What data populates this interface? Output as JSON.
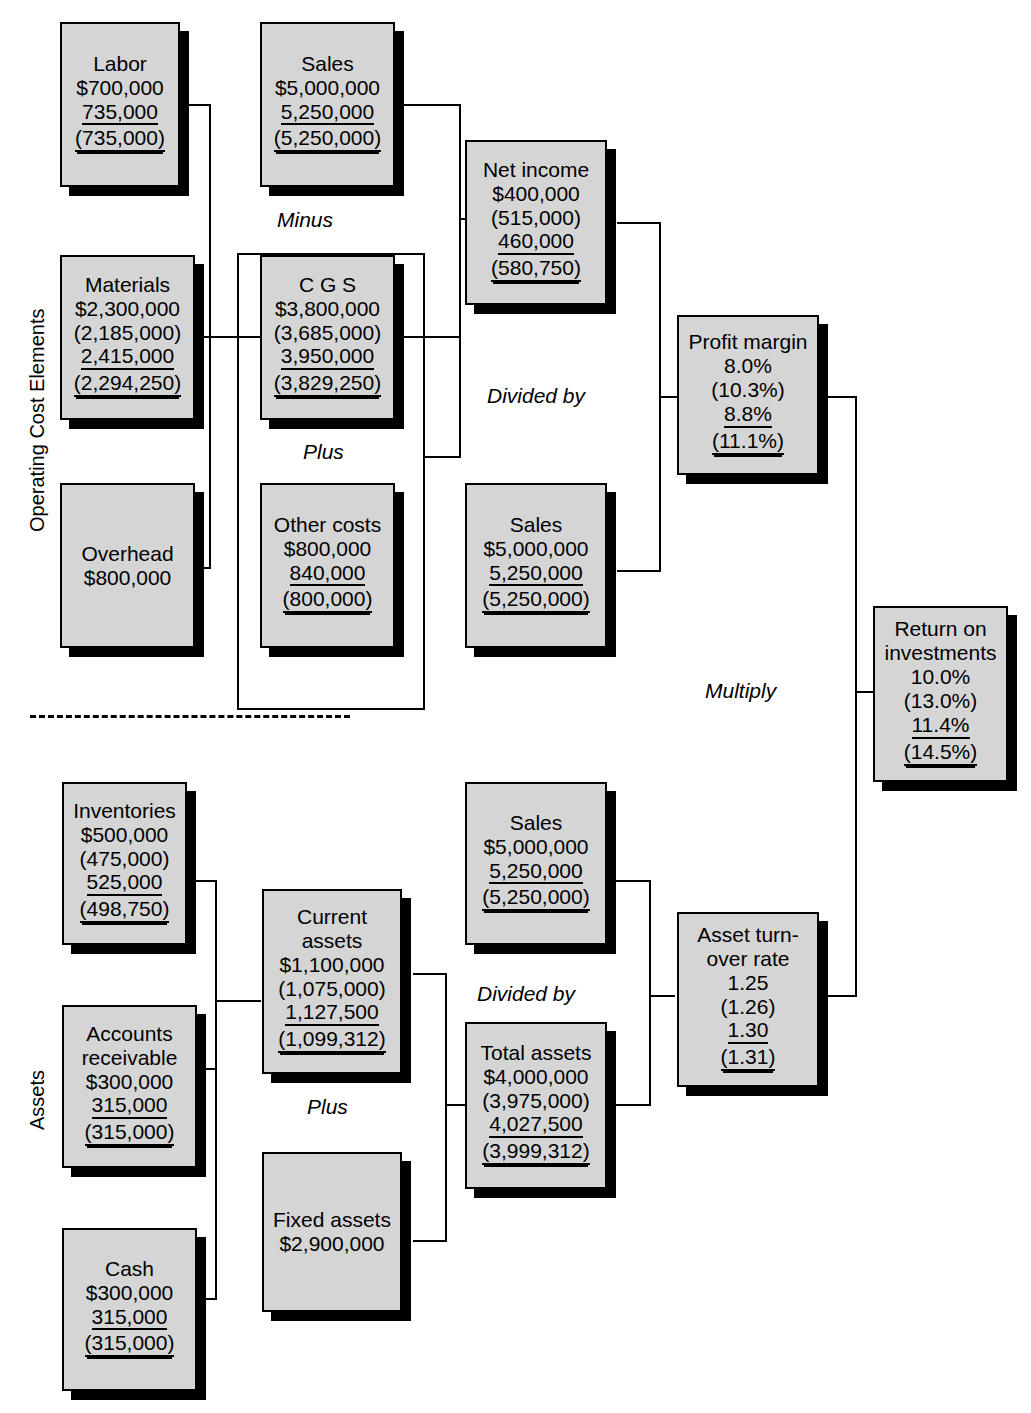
{
  "diagram": {
    "section_labels": {
      "top": "Operating Cost Elements",
      "bottom": "Assets"
    },
    "operators": {
      "minus": "Minus",
      "plus_top": "Plus",
      "divided_by_top": "Divided by",
      "multiply": "Multiply",
      "plus_bottom": "Plus",
      "divided_by_bottom": "Divided by"
    },
    "colors": {
      "box_fill": "#d5d5d5",
      "box_border": "#000000",
      "shadow": "#000000",
      "background": "#ffffff"
    }
  },
  "nodes": {
    "labor": {
      "title": "Labor",
      "lines": [
        "$700,000",
        "735,000",
        "(735,000)"
      ]
    },
    "materials": {
      "title": "Materials",
      "lines": [
        "$2,300,000",
        "(2,185,000)",
        "2,415,000",
        "(2,294,250)"
      ]
    },
    "overhead": {
      "title": "Overhead",
      "lines": [
        "$800,000"
      ]
    },
    "sales_top": {
      "title": "Sales",
      "lines": [
        "$5,000,000",
        "5,250,000",
        "(5,250,000)"
      ]
    },
    "cgs": {
      "title": "C G S",
      "lines": [
        "$3,800,000",
        "(3,685,000)",
        "3,950,000",
        "(3,829,250)"
      ]
    },
    "other_costs": {
      "title": "Other costs",
      "lines": [
        "$800,000",
        "840,000",
        "(800,000)"
      ]
    },
    "net_income": {
      "title": "Net income",
      "lines": [
        "$400,000",
        "(515,000)",
        "460,000",
        "(580,750)"
      ]
    },
    "sales_mid": {
      "title": "Sales",
      "lines": [
        "$5,000,000",
        "5,250,000",
        "(5,250,000)"
      ]
    },
    "profit_margin": {
      "title": "Profit margin",
      "lines": [
        "8.0%",
        "(10.3%)",
        "8.8%",
        "(11.1%)"
      ]
    },
    "return_on_investments": {
      "title_line1": "Return on",
      "title_line2": "investments",
      "lines": [
        "10.0%",
        "(13.0%)",
        "11.4%",
        "(14.5%)"
      ]
    },
    "inventories": {
      "title": "Inventories",
      "lines": [
        "$500,000",
        "(475,000)",
        "525,000",
        "(498,750)"
      ]
    },
    "accounts_receivable": {
      "title_line1": "Accounts",
      "title_line2": "receivable",
      "lines": [
        "$300,000",
        "315,000",
        "(315,000)"
      ]
    },
    "cash": {
      "title": "Cash",
      "lines": [
        "$300,000",
        "315,000",
        "(315,000)"
      ]
    },
    "current_assets": {
      "title_line1": "Current",
      "title_line2": "assets",
      "lines": [
        "$1,100,000",
        "(1,075,000)",
        "1,127,500",
        "(1,099,312)"
      ]
    },
    "fixed_assets": {
      "title": "Fixed assets",
      "lines": [
        "$2,900,000"
      ]
    },
    "sales_bottom": {
      "title": "Sales",
      "lines": [
        "$5,000,000",
        "5,250,000",
        "(5,250,000)"
      ]
    },
    "total_assets": {
      "title": "Total assets",
      "lines": [
        "$4,000,000",
        "(3,975,000)",
        "4,027,500",
        "(3,999,312)"
      ]
    },
    "asset_turnover": {
      "title_line1": "Asset turn-",
      "title_line2": "over rate",
      "lines": [
        "1.25",
        "(1.26)",
        "1.30",
        "(1.31)"
      ]
    }
  }
}
